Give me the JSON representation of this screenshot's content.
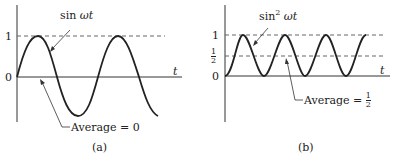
{
  "panels": [
    {
      "id": "a",
      "caption": "(a)",
      "curve_label": "sin",
      "curve_label_var": "ωt",
      "y_tick_1": "1",
      "y_tick_0": "0",
      "x_axis_label": "t",
      "average_label": "Average = 0"
    },
    {
      "id": "b",
      "caption": "(b)",
      "curve_label": "sin",
      "curve_label_sup": "2",
      "curve_label_var": "ωt",
      "y_tick_1": "1",
      "y_tick_half_num": "1",
      "y_tick_half_den": "2",
      "y_tick_0": "0",
      "x_axis_label": "t",
      "average_label": "Average = ",
      "average_num": "1",
      "average_den": "2"
    }
  ],
  "colors": {
    "curve": "#222222",
    "axis": "#333333",
    "dashed": "#555555"
  }
}
